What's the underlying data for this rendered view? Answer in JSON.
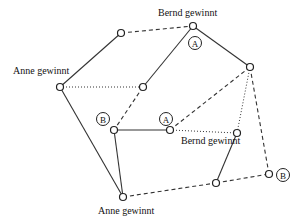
{
  "diagram": {
    "type": "game-graph",
    "vertices": [
      {
        "id": "p1",
        "x": 121,
        "y": 33
      },
      {
        "id": "p2",
        "x": 193,
        "y": 26,
        "label": "Bernd gewinnt",
        "label_x": 158,
        "label_y": 16,
        "badge": "A",
        "badge_x": 195,
        "badge_y": 43
      },
      {
        "id": "p3",
        "x": 60,
        "y": 87,
        "label": "Anne gewinnt",
        "label_x": 13,
        "label_y": 74
      },
      {
        "id": "p4",
        "x": 143,
        "y": 87
      },
      {
        "id": "p5",
        "x": 250,
        "y": 67
      },
      {
        "id": "p6",
        "x": 114,
        "y": 130,
        "badge": "B",
        "badge_x": 103,
        "badge_y": 119
      },
      {
        "id": "p7",
        "x": 170,
        "y": 130,
        "badge": "A",
        "badge_x": 166,
        "badge_y": 119
      },
      {
        "id": "p8",
        "x": 237,
        "y": 133,
        "label": "Bernd gewinnt",
        "label_x": 181,
        "label_y": 144
      },
      {
        "id": "p9",
        "x": 216,
        "y": 183
      },
      {
        "id": "p10",
        "x": 269,
        "y": 174,
        "badge": "B",
        "badge_x": 283,
        "badge_y": 175
      },
      {
        "id": "p11",
        "x": 123,
        "y": 197,
        "label": "Anne gewinnt",
        "label_x": 98,
        "label_y": 214
      }
    ],
    "edges": [
      {
        "from": "p1",
        "to": "p2",
        "style": "dashed"
      },
      {
        "from": "p1",
        "to": "p3",
        "style": "solid"
      },
      {
        "from": "p2",
        "to": "p5",
        "style": "solid"
      },
      {
        "from": "p2",
        "to": "p4",
        "style": "solid"
      },
      {
        "from": "p3",
        "to": "p4",
        "style": "dotted"
      },
      {
        "from": "p3",
        "to": "p11",
        "style": "solid"
      },
      {
        "from": "p4",
        "to": "p6",
        "style": "dashed"
      },
      {
        "from": "p5",
        "to": "p7",
        "style": "dashed"
      },
      {
        "from": "p5",
        "to": "p8",
        "style": "dotted"
      },
      {
        "from": "p5",
        "to": "p10",
        "style": "dashed"
      },
      {
        "from": "p6",
        "to": "p7",
        "style": "solid"
      },
      {
        "from": "p6",
        "to": "p11",
        "style": "solid"
      },
      {
        "from": "p7",
        "to": "p8",
        "style": "dotted"
      },
      {
        "from": "p8",
        "to": "p9",
        "style": "solid"
      },
      {
        "from": "p9",
        "to": "p10",
        "style": "dashed"
      },
      {
        "from": "p11",
        "to": "p9",
        "style": "dashed"
      }
    ],
    "labels": {
      "bernd_wins": "Bernd gewinnt",
      "anne_wins": "Anne gewinnt",
      "player_a": "A",
      "player_b": "B"
    }
  }
}
